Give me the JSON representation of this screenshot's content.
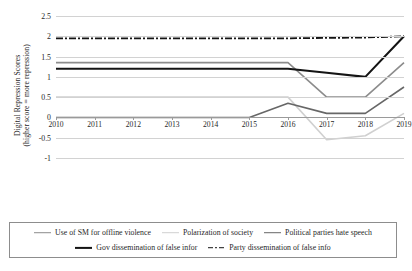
{
  "chart_data": {
    "type": "line",
    "title": "",
    "xlabel": "",
    "ylabel": "Digital Repression Scores (higher score = more repression)",
    "ylabel_line1": "Digital Repression Scores",
    "ylabel_line2": "(higher score = more repression)",
    "categories": [
      "2010",
      "2011",
      "2012",
      "2013",
      "2014",
      "2015",
      "2016",
      "2017",
      "2018",
      "2019"
    ],
    "ylim": [
      -1,
      2.5
    ],
    "yticks": [
      2.5,
      2,
      1.5,
      1,
      0.5,
      0,
      -0.5,
      -1
    ],
    "ytick_labels": [
      "2.5",
      "2",
      "1.5",
      "1",
      "0.5",
      "0",
      "-0.5",
      "-1"
    ],
    "grid": true,
    "legend_position": "bottom",
    "series": [
      {
        "name": "Use of SM for offline violence",
        "color": "#8c8c8c",
        "width": 1.6,
        "dash": "",
        "values": [
          1.35,
          1.35,
          1.35,
          1.35,
          1.35,
          1.35,
          1.35,
          0.5,
          0.5,
          1.35
        ]
      },
      {
        "name": "Polarization of society",
        "color": "#d0d0d0",
        "width": 1.6,
        "dash": "",
        "values": [
          0.5,
          0.5,
          0.5,
          0.5,
          0.5,
          0.5,
          0.5,
          -0.55,
          -0.45,
          0.1
        ]
      },
      {
        "name": "Political parties hate speech",
        "color": "#676767",
        "width": 1.6,
        "dash": "",
        "values": [
          0,
          0,
          0,
          0,
          0,
          0,
          0.35,
          0.1,
          0.1,
          0.75
        ]
      },
      {
        "name": "Gov dissemination of false infor",
        "color": "#141414",
        "width": 2.1,
        "dash": "",
        "values": [
          1.2,
          1.2,
          1.2,
          1.2,
          1.2,
          1.2,
          1.2,
          1.1,
          1.0,
          2.0
        ]
      },
      {
        "name": "Party dissemination of false info",
        "color": "#141414",
        "width": 1.8,
        "dash": "7,2,2,2",
        "values": [
          1.95,
          1.95,
          1.95,
          1.95,
          1.95,
          1.95,
          1.95,
          1.96,
          1.97,
          2.0
        ]
      }
    ]
  },
  "legend": {
    "row1": [
      {
        "label": "Use of SM for offline violence",
        "color": "#8c8c8c",
        "style": "solid",
        "thick": false
      },
      {
        "label": "Polarization of society",
        "color": "#d0d0d0",
        "style": "solid",
        "thick": false
      },
      {
        "label": "Political parties hate speech",
        "color": "#676767",
        "style": "solid",
        "thick": false
      }
    ],
    "row2": [
      {
        "label": "Gov dissemination of false infor",
        "color": "#141414",
        "style": "solid",
        "thick": true
      },
      {
        "label": "Party dissemination of false info",
        "color": "#141414",
        "style": "dashdot",
        "thick": false
      }
    ]
  }
}
